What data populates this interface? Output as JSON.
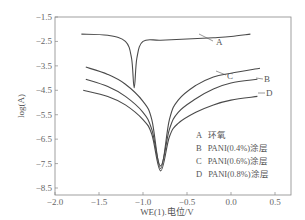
{
  "chart_data": {
    "type": "line",
    "title": "",
    "xlabel": "WE(1).电位/V",
    "ylabel": "log(A)",
    "xlim": [
      -2.0,
      0.68
    ],
    "ylim": [
      -8.5,
      -1.5
    ],
    "xticks": [
      "-2.0",
      "-1.5",
      "-1.0",
      "-0.5",
      "0.0",
      "0.5"
    ],
    "yticks": [
      "-1.5",
      "-2.5",
      "-3.5",
      "-4.5",
      "-5.5",
      "-6.5",
      "-7.5",
      "-8.5"
    ],
    "grid": false,
    "legend_position": "lower right (inside)",
    "legend": [
      {
        "key": "A",
        "label": "环氧"
      },
      {
        "key": "B",
        "label": "PANI(0.4%)涂层"
      },
      {
        "key": "C",
        "label": "PANI(0.6%)涂层"
      },
      {
        "key": "D",
        "label": "PANI(0.8%)涂层"
      }
    ],
    "series": [
      {
        "name": "A",
        "x": [
          -1.7,
          -1.4,
          -1.2,
          -1.13,
          -1.1,
          -1.07,
          -1.0,
          -0.8,
          -0.5,
          -0.2,
          0.0,
          0.22
        ],
        "y": [
          -2.2,
          -2.25,
          -2.5,
          -3.2,
          -4.4,
          -3.2,
          -2.5,
          -2.45,
          -2.4,
          -2.35,
          -2.3,
          -2.2
        ]
      },
      {
        "name": "B",
        "x": [
          -1.65,
          -1.4,
          -1.2,
          -1.0,
          -0.9,
          -0.8,
          -0.7,
          -0.6,
          -0.4,
          -0.2,
          0.0,
          0.3
        ],
        "y": [
          -4.05,
          -4.35,
          -4.75,
          -5.4,
          -6.1,
          -7.6,
          -6.1,
          -5.4,
          -4.85,
          -4.45,
          -4.2,
          -4.05
        ]
      },
      {
        "name": "C",
        "x": [
          -1.65,
          -1.4,
          -1.2,
          -1.0,
          -0.9,
          -0.8,
          -0.7,
          -0.6,
          -0.4,
          -0.2,
          0.0,
          0.33
        ],
        "y": [
          -3.55,
          -3.85,
          -4.25,
          -4.95,
          -5.7,
          -7.7,
          -5.7,
          -4.9,
          -4.3,
          -3.95,
          -3.8,
          -3.6
        ]
      },
      {
        "name": "D",
        "x": [
          -1.68,
          -1.4,
          -1.2,
          -1.0,
          -0.9,
          -0.8,
          -0.7,
          -0.6,
          -0.4,
          -0.2,
          0.0,
          0.3
        ],
        "y": [
          -4.5,
          -4.75,
          -5.1,
          -5.7,
          -6.3,
          -7.8,
          -6.4,
          -5.85,
          -5.4,
          -5.1,
          -4.9,
          -4.75
        ]
      }
    ],
    "annotations": [
      {
        "text": "A",
        "x": 0.0,
        "y": -2.7
      },
      {
        "text": "B",
        "x": 0.38,
        "y": -3.95
      },
      {
        "text": "C",
        "x": 0.1,
        "y": -3.85
      },
      {
        "text": "D",
        "x": 0.38,
        "y": -4.55
      }
    ]
  }
}
